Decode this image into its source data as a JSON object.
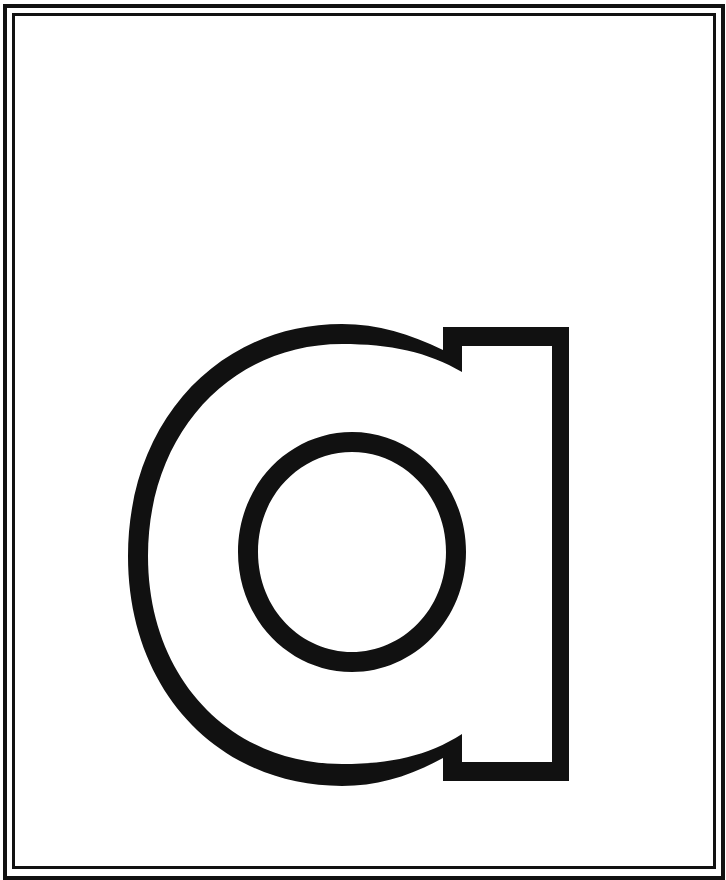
{
  "page": {
    "type": "letter coloring page",
    "letter": "a",
    "case": "lowercase",
    "style": "outline"
  },
  "colors": {
    "background": "#ffffff",
    "outline": "#111111",
    "fill": "#ffffff"
  }
}
